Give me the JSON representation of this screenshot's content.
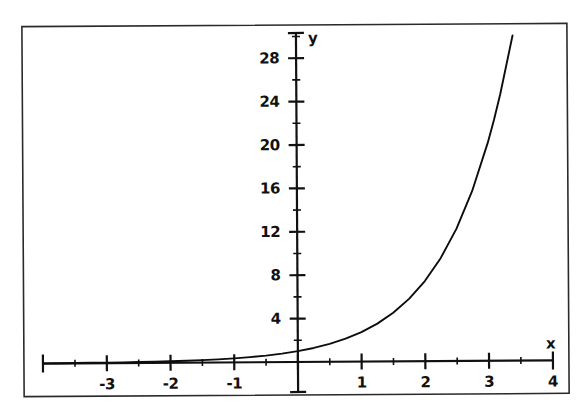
{
  "figure": {
    "background_color": "#ffffff",
    "ink_color": "#111111",
    "frame": {
      "visible": true,
      "color": "#2a2a2a",
      "x": 23,
      "y": 25,
      "width": 545,
      "height": 370
    }
  },
  "chart_data": {
    "type": "line",
    "title": "",
    "subtitle": "",
    "xlabel": "x",
    "ylabel": "y",
    "function": "y = e^x",
    "grid": false,
    "legend": null,
    "xlim": [
      -4,
      4
    ],
    "ylim": [
      0,
      30
    ],
    "x_major_ticks": [
      -4,
      -3,
      -2,
      -1,
      0,
      1,
      2,
      3,
      4
    ],
    "x_tick_labels": [
      "",
      "-3",
      "-2",
      "-1",
      "",
      "1",
      "2",
      "3",
      "4"
    ],
    "x_minor_ticks": [
      -3.5,
      -2.5,
      -1.5,
      -0.5,
      0.5,
      1.5,
      2.5,
      3.5
    ],
    "y_major_ticks": [
      4,
      8,
      12,
      16,
      20,
      24,
      28
    ],
    "y_tick_labels": [
      "4",
      "8",
      "12",
      "16",
      "20",
      "24",
      "28"
    ],
    "y_minor_ticks": [
      2,
      6,
      10,
      14,
      18,
      22,
      26,
      30
    ],
    "x": [
      -4.0,
      -3.75,
      -3.5,
      -3.25,
      -3.0,
      -2.75,
      -2.5,
      -2.25,
      -2.0,
      -1.75,
      -1.5,
      -1.25,
      -1.0,
      -0.75,
      -0.5,
      -0.25,
      0.0,
      0.25,
      0.5,
      0.75,
      1.0,
      1.25,
      1.5,
      1.75,
      2.0,
      2.25,
      2.5,
      2.75,
      3.0,
      3.1,
      3.2,
      3.4
    ],
    "y": [
      0.018,
      0.024,
      0.03,
      0.039,
      0.05,
      0.064,
      0.082,
      0.105,
      0.135,
      0.174,
      0.223,
      0.287,
      0.368,
      0.472,
      0.607,
      0.779,
      1.0,
      1.284,
      1.649,
      2.117,
      2.718,
      3.49,
      4.482,
      5.755,
      7.389,
      9.488,
      12.182,
      15.643,
      20.086,
      22.198,
      24.533,
      29.964
    ],
    "series": [
      {
        "name": "y = e^x",
        "color": "#0d0d0d",
        "line_width": 1.9,
        "marker": "none"
      }
    ],
    "annotations": [
      {
        "text": "y",
        "position": "y-axis-top"
      },
      {
        "text": "x",
        "position": "x-axis-right"
      }
    ]
  }
}
